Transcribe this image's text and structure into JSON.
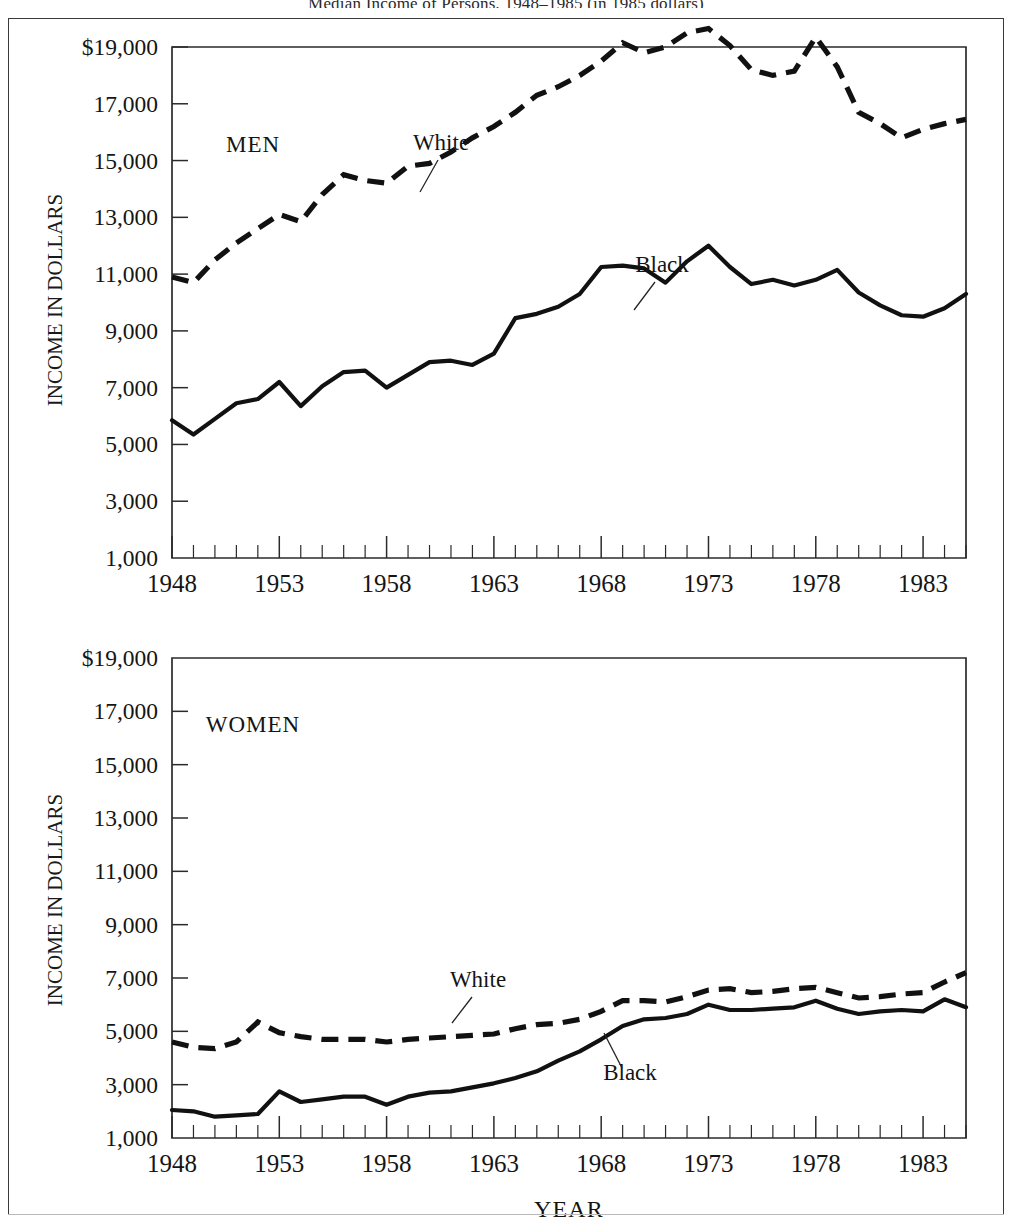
{
  "figure": {
    "title_fragment": "Median Income of Persons, 1948–1985 (in 1985 dollars)",
    "panels": [
      {
        "id": "men",
        "group_label": "MEN",
        "ylabel": "INCOME IN DOLLARS",
        "xlabel": "",
        "annotations": [
          {
            "text": "White",
            "series": "white"
          },
          {
            "text": "Black",
            "series": "black"
          }
        ]
      },
      {
        "id": "women",
        "group_label": "WOMEN",
        "ylabel": "INCOME IN DOLLARS",
        "xlabel": "YEAR",
        "annotations": [
          {
            "text": "White",
            "series": "white"
          },
          {
            "text": "Black",
            "series": "black"
          }
        ]
      }
    ],
    "ytick_labels": [
      "$19,000",
      "17,000",
      "15,000",
      "13,000",
      "11,000",
      "9,000",
      "7,000",
      "5,000",
      "3,000",
      "1,000"
    ],
    "xtick_labels": [
      "1948",
      "1953",
      "1958",
      "1963",
      "1968",
      "1973",
      "1978",
      "1983"
    ],
    "colors": {
      "ink": "#111111",
      "frame": "#3a3a3a",
      "paper": "#ffffff"
    }
  },
  "chart_data": [
    {
      "type": "line",
      "id": "men",
      "title": "MEN",
      "xlabel": "",
      "ylabel": "INCOME IN DOLLARS",
      "xlim": [
        1948,
        1985
      ],
      "ylim": [
        1000,
        19000
      ],
      "ytick_values": [
        19000,
        17000,
        15000,
        13000,
        11000,
        9000,
        7000,
        5000,
        3000,
        1000
      ],
      "xtick_values": [
        1948,
        1953,
        1958,
        1963,
        1968,
        1973,
        1978,
        1983
      ],
      "grid": false,
      "legend": "inline-annotation",
      "x": [
        1948,
        1949,
        1950,
        1951,
        1952,
        1953,
        1954,
        1955,
        1956,
        1957,
        1958,
        1959,
        1960,
        1961,
        1962,
        1963,
        1964,
        1965,
        1966,
        1967,
        1968,
        1969,
        1970,
        1971,
        1972,
        1973,
        1974,
        1975,
        1976,
        1977,
        1978,
        1979,
        1980,
        1981,
        1982,
        1983,
        1984,
        1985
      ],
      "series": [
        {
          "name": "White",
          "style": "dashed",
          "values": [
            10900,
            10700,
            11500,
            12100,
            12600,
            13100,
            12850,
            13800,
            14500,
            14300,
            14200,
            14800,
            14900,
            15300,
            15800,
            16200,
            16700,
            17300,
            17600,
            18000,
            18500,
            19150,
            18800,
            19000,
            19500,
            19650,
            19050,
            18200,
            18000,
            18150,
            19350,
            18300,
            16700,
            16300,
            15800,
            16100,
            16300,
            16450
          ]
        },
        {
          "name": "Black",
          "style": "solid",
          "values": [
            5850,
            5350,
            5900,
            6450,
            6600,
            7200,
            6350,
            7050,
            7550,
            7600,
            7000,
            7450,
            7900,
            7950,
            7800,
            8200,
            9450,
            9600,
            9850,
            10300,
            11250,
            11300,
            11200,
            10700,
            11450,
            12000,
            11250,
            10650,
            10800,
            10600,
            10800,
            11150,
            10350,
            9900,
            9550,
            9500,
            9800,
            10300
          ]
        }
      ]
    },
    {
      "type": "line",
      "id": "women",
      "title": "WOMEN",
      "xlabel": "YEAR",
      "ylabel": "INCOME IN DOLLARS",
      "xlim": [
        1948,
        1985
      ],
      "ylim": [
        1000,
        19000
      ],
      "ytick_values": [
        19000,
        17000,
        15000,
        13000,
        11000,
        9000,
        7000,
        5000,
        3000,
        1000
      ],
      "xtick_values": [
        1948,
        1953,
        1958,
        1963,
        1968,
        1973,
        1978,
        1983
      ],
      "grid": false,
      "legend": "inline-annotation",
      "x": [
        1948,
        1949,
        1950,
        1951,
        1952,
        1953,
        1954,
        1955,
        1956,
        1957,
        1958,
        1959,
        1960,
        1961,
        1962,
        1963,
        1964,
        1965,
        1966,
        1967,
        1968,
        1969,
        1970,
        1971,
        1972,
        1973,
        1974,
        1975,
        1976,
        1977,
        1978,
        1979,
        1980,
        1981,
        1982,
        1983,
        1984,
        1985
      ],
      "series": [
        {
          "name": "White",
          "style": "dashed",
          "values": [
            4600,
            4400,
            4350,
            4600,
            5350,
            4950,
            4800,
            4700,
            4700,
            4700,
            4600,
            4700,
            4750,
            4800,
            4850,
            4900,
            5100,
            5250,
            5300,
            5450,
            5750,
            6150,
            6150,
            6100,
            6300,
            6550,
            6600,
            6450,
            6500,
            6600,
            6650,
            6450,
            6250,
            6300,
            6400,
            6450,
            6850,
            7200
          ]
        },
        {
          "name": "Black",
          "style": "solid",
          "values": [
            2050,
            2000,
            1800,
            1850,
            1900,
            2750,
            2350,
            2450,
            2550,
            2550,
            2250,
            2550,
            2700,
            2750,
            2900,
            3050,
            3250,
            3500,
            3900,
            4250,
            4700,
            5200,
            5450,
            5500,
            5650,
            6000,
            5800,
            5800,
            5850,
            5900,
            6150,
            5850,
            5650,
            5750,
            5800,
            5750,
            6200,
            5900
          ]
        }
      ]
    }
  ]
}
